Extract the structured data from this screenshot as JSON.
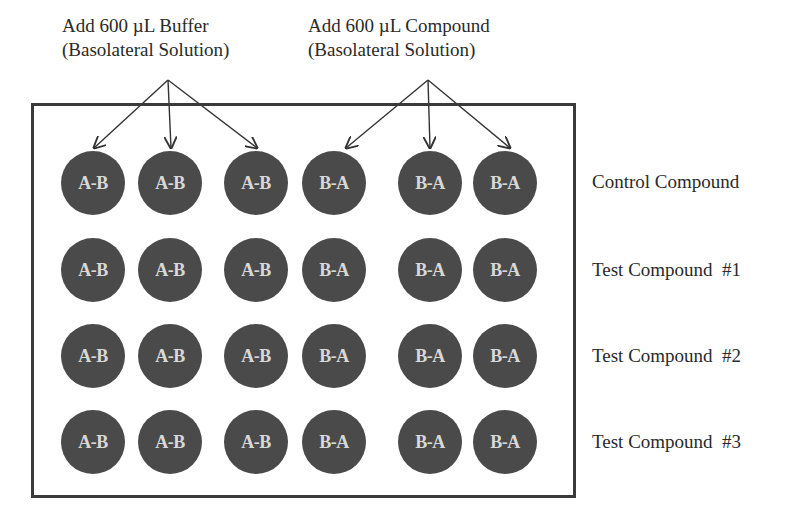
{
  "headers": [
    {
      "line1": "Add 600 µL Buffer",
      "line2": "(Basolateral Solution)"
    },
    {
      "line1": "Add 600 µL Compound",
      "line2": "(Basolateral Solution)"
    }
  ],
  "columns": [
    "A-B",
    "A-B",
    "A-B",
    "B-A",
    "B-A",
    "B-A"
  ],
  "rows": [
    {
      "label": "Control Compound",
      "wells": [
        "A-B",
        "A-B",
        "A-B",
        "B-A",
        "B-A",
        "B-A"
      ]
    },
    {
      "label": "Test Compound  #1",
      "wells": [
        "A-B",
        "A-B",
        "A-B",
        "B-A",
        "B-A",
        "B-A"
      ]
    },
    {
      "label": "Test Compound  #2",
      "wells": [
        "A-B",
        "A-B",
        "A-B",
        "B-A",
        "B-A",
        "B-A"
      ]
    },
    {
      "label": "Test Compound  #3",
      "wells": [
        "A-B",
        "A-B",
        "A-B",
        "B-A",
        "B-A",
        "B-A"
      ]
    }
  ],
  "colors": {
    "well_fill": "#4a4a4a",
    "well_text": "#d8d8d8",
    "border": "#3a3a3a"
  }
}
